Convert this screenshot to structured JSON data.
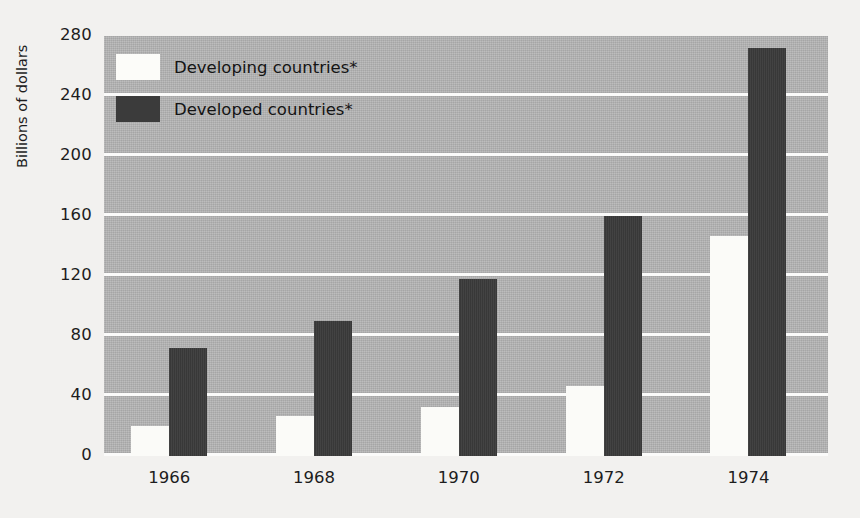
{
  "chart_data": {
    "type": "bar",
    "title": "",
    "subtitle": "",
    "xlabel": "",
    "ylabel": "Billions of dollars",
    "categories": [
      "1966",
      "1968",
      "1970",
      "1972",
      "1974"
    ],
    "series": [
      {
        "name": "Developing countries*",
        "color": "#fbfbf8",
        "values": [
          20,
          27,
          33,
          47,
          147
        ]
      },
      {
        "name": "Developed countries*",
        "color": "#3b3b3b",
        "values": [
          72,
          90,
          118,
          160,
          272
        ]
      }
    ],
    "ylim": [
      0,
      280
    ],
    "ytick_values": [
      0,
      40,
      80,
      120,
      160,
      200,
      240,
      280
    ],
    "ytick_labels": [
      "0",
      "40",
      "80",
      "120",
      "160",
      "200",
      "240",
      "280"
    ],
    "grid": true,
    "grid_color": "#fbfbfa",
    "plot_background": "#b6b6b6",
    "page_background": "#f2f1ef",
    "legend_position": "upper left",
    "legend": [
      {
        "label": "Developing countries*",
        "swatch": "#fbfbf8"
      },
      {
        "label": "Developed countries*",
        "swatch": "#3b3b3b"
      }
    ]
  }
}
